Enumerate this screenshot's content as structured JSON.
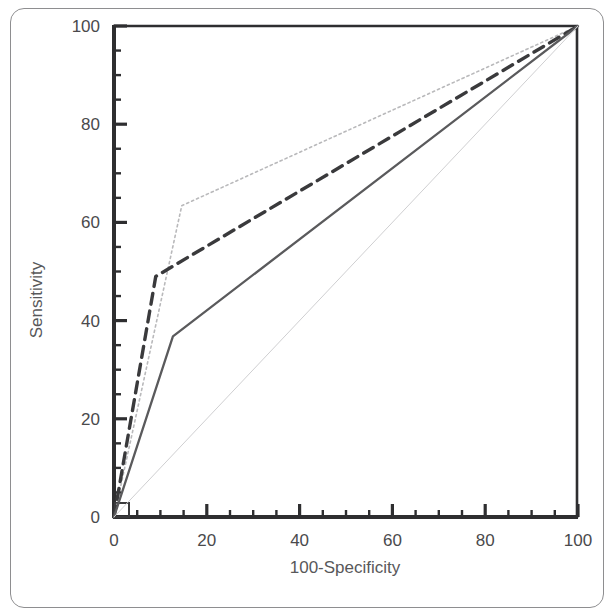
{
  "chart_data": {
    "type": "line",
    "title": "",
    "xlabel": "100-Specificity",
    "ylabel": "Sensitivity",
    "xlim": [
      0,
      100
    ],
    "ylim": [
      0,
      100
    ],
    "grid": false,
    "legend": "none",
    "x_ticks": [
      0,
      20,
      40,
      60,
      80,
      100
    ],
    "y_ticks": [
      0,
      20,
      40,
      60,
      80,
      100
    ],
    "x_tick_labels": [
      "0",
      "20",
      "40",
      "60",
      "80",
      "100"
    ],
    "y_tick_labels": [
      "0",
      "20",
      "40",
      "60",
      "80",
      "100"
    ],
    "x_minor_step": 5,
    "y_minor_step": 5,
    "series": [
      {
        "name": "roc-curve-dotted",
        "style": "dotted",
        "color": "#b9b9bb",
        "width": 1.6,
        "x": [
          0,
          14.6,
          100
        ],
        "y": [
          0,
          63.4,
          100
        ]
      },
      {
        "name": "roc-curve-dashed",
        "style": "dashed",
        "color": "#3a3a3c",
        "width": 3.4,
        "x": [
          0,
          9.0,
          100
        ],
        "y": [
          0,
          49.0,
          100
        ]
      },
      {
        "name": "roc-curve-solid",
        "style": "solid",
        "color": "#5a5a5c",
        "width": 2.3,
        "x": [
          0,
          12.7,
          100
        ],
        "y": [
          0,
          36.8,
          100
        ]
      },
      {
        "name": "reference-diagonal",
        "style": "solid-thin",
        "color": "#cfcfd1",
        "width": 1.0,
        "x": [
          0,
          100
        ],
        "y": [
          0,
          100
        ]
      }
    ]
  },
  "axes": {
    "x_title": "100-Specificity",
    "y_title": "Sensitivity"
  }
}
